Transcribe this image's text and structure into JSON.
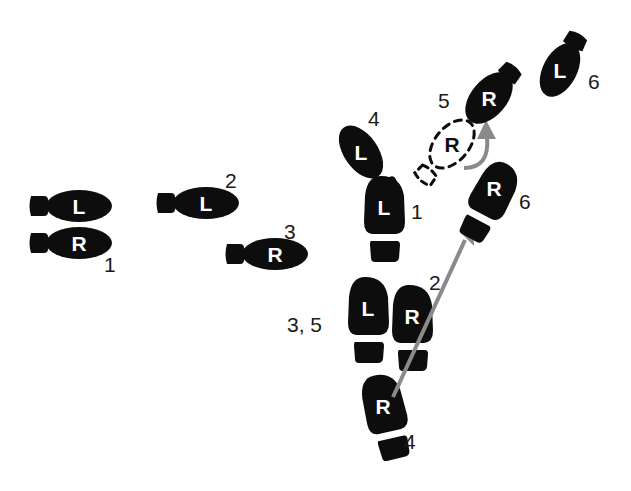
{
  "diagram": {
    "background_color": "#ffffff",
    "footprint_color": "#0d0d0d",
    "letter_color": "#ffffff",
    "arrow_color": "#8a8a8a",
    "width": 631,
    "height": 491
  },
  "footprints": [
    {
      "id": "fp-l-1-left",
      "foot": "L",
      "label": "",
      "style": "solid",
      "orientation": "horizontal-right"
    },
    {
      "id": "fp-r-1-left",
      "foot": "R",
      "label": "1",
      "style": "solid",
      "orientation": "horizontal-right"
    },
    {
      "id": "fp-l-2",
      "foot": "L",
      "label": "2",
      "style": "solid",
      "orientation": "horizontal-right"
    },
    {
      "id": "fp-r-3",
      "foot": "R",
      "label": "3",
      "style": "solid",
      "orientation": "horizontal-right"
    },
    {
      "id": "fp-l-4",
      "foot": "L",
      "label": "4",
      "style": "solid",
      "orientation": "tilted-up-right"
    },
    {
      "id": "fp-l-1-mid",
      "foot": "L",
      "label": "1",
      "style": "solid",
      "orientation": "vertical-up"
    },
    {
      "id": "fp-l-35",
      "foot": "L",
      "label": "3, 5",
      "style": "solid",
      "orientation": "vertical-up"
    },
    {
      "id": "fp-r-2",
      "foot": "R",
      "label": "2",
      "style": "solid",
      "orientation": "vertical-up"
    },
    {
      "id": "fp-r-4-bottom",
      "foot": "R",
      "label": "4",
      "style": "solid",
      "orientation": "vertical-up-tilted"
    },
    {
      "id": "fp-r-5-ghost",
      "foot": "R",
      "label": "5",
      "style": "dashed",
      "orientation": "diagonal-up-right"
    },
    {
      "id": "fp-r-5",
      "foot": "R",
      "label": "",
      "style": "solid",
      "orientation": "diagonal-up-right"
    },
    {
      "id": "fp-r-6",
      "foot": "R",
      "label": "6",
      "style": "solid",
      "orientation": "diagonal-up-right"
    },
    {
      "id": "fp-l-6",
      "foot": "L",
      "label": "6",
      "style": "solid",
      "orientation": "diagonal-up-right"
    }
  ],
  "letters": {
    "left_foot": "L",
    "right_foot": "R"
  },
  "labels": {
    "l1_left": "",
    "r1_left": "1",
    "l2": "2",
    "r3": "3",
    "l4": "4",
    "l1_mid": "1",
    "l35": "3, 5",
    "r2": "2",
    "r4_bottom": "4",
    "r5_ghost": "5",
    "r6": "6",
    "l6": "6"
  },
  "arrows": [
    {
      "id": "long-arrow",
      "from": "R4 footprint",
      "to": "R6 footprint heel",
      "kind": "straight"
    },
    {
      "id": "curve-arrow",
      "from": "R ghost footprint",
      "to": "R5 footprint heel",
      "kind": "curved"
    }
  ]
}
